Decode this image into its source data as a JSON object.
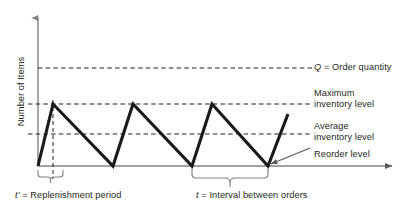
{
  "figure": {
    "axes": {
      "y_axis_title": "Number of Items",
      "x_axis_title": ""
    },
    "annotations": {
      "order_quantity": {
        "symbol": "Q",
        "text": " = Order quantity"
      },
      "maximum_inventory": {
        "line1": "Maximum",
        "line2": "inventory level"
      },
      "average_inventory": {
        "line1": "Average",
        "line2": "inventory level"
      },
      "reorder_level": {
        "text": "Reorder level"
      },
      "replenishment_period": {
        "symbol": "t'",
        "text": " = Replenishment period"
      },
      "interval_between_orders": {
        "symbol": "t",
        "text": " = Interval between orders"
      }
    },
    "colors": {
      "curve": "#1a1a1a",
      "axis": "#808285",
      "dashed_line": "#231f20",
      "text": "#231f20",
      "background": "#ffffff"
    }
  },
  "chart_data": {
    "type": "line",
    "title": "",
    "xlabel": "",
    "ylabel": "Number of Items",
    "grid": false,
    "legend_position": "right",
    "axis_px": {
      "x_origin": 38,
      "x_end": 396,
      "y_top": 14,
      "y_baseline": 166
    },
    "reference_lines": [
      {
        "name": "Q = Order quantity",
        "label": "Q = Order quantity",
        "y_px": 68,
        "style": "dashed",
        "x_from": 38,
        "x_to": 312
      },
      {
        "name": "Maximum inventory level",
        "label": "Maximum inventory level",
        "y_px": 104,
        "style": "dashed",
        "x_from": 28,
        "x_to": 312
      },
      {
        "name": "Average inventory level",
        "label": "Average inventory level",
        "y_px": 134,
        "style": "dashed",
        "x_from": 28,
        "x_to": 312
      }
    ],
    "vertical_marker": {
      "name": "replenishment-marker",
      "x_px": 53,
      "y_from": 104,
      "y_to": 178,
      "style": "dashed"
    },
    "series": [
      {
        "name": "inventory-level",
        "points_px": [
          {
            "x": 38,
            "y": 166
          },
          {
            "x": 53,
            "y": 104
          },
          {
            "x": 113,
            "y": 166
          },
          {
            "x": 133,
            "y": 104
          },
          {
            "x": 192,
            "y": 166
          },
          {
            "x": 212,
            "y": 104
          },
          {
            "x": 268,
            "y": 166
          },
          {
            "x": 288,
            "y": 114
          }
        ]
      }
    ],
    "braces": [
      {
        "name": "replenishment-period-brace",
        "x_from": 38,
        "x_to": 63,
        "y_px": 170,
        "label": "t' = Replenishment period"
      },
      {
        "name": "interval-between-orders-brace",
        "x_from": 192,
        "x_to": 268,
        "y_px": 170,
        "label": "t = Interval between orders"
      }
    ],
    "callout": {
      "name": "reorder-level-callout",
      "from_px": {
        "x": 310,
        "y": 148
      },
      "to_px": {
        "x": 268,
        "y": 166
      }
    }
  }
}
